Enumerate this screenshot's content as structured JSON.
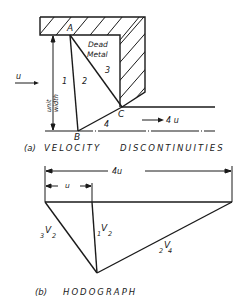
{
  "figure_a": {
    "caption": "(a) VELOCITY DISCONTINUITIES",
    "caption_prefix": "(a)",
    "caption_text": "VELOCITY DISCONTINUITIES",
    "points": {
      "A": "A",
      "B": "B",
      "C": "C"
    },
    "regions": {
      "r1": "1",
      "r2": "2",
      "r3": "3",
      "r4": "4"
    },
    "dead_metal_line1": "Dead",
    "dead_metal_line2": "Metal",
    "inlet_velocity": "u",
    "outlet_velocity": "4 u",
    "unit_width_line1": "unit",
    "unit_width_line2": "width"
  },
  "figure_b": {
    "caption_prefix": "(b)",
    "caption_text": "HODOGRAPH",
    "total_velocity_label": "4u",
    "inlet_velocity_label": "u",
    "vectors": [
      {
        "pre": "3",
        "v": "V",
        "post": "2"
      },
      {
        "pre": "1",
        "v": "V",
        "post": "2"
      },
      {
        "pre": "2",
        "v": "V",
        "post": "4"
      }
    ]
  },
  "colors": {
    "ink": "#1a1a1a",
    "background": "#ffffff"
  }
}
